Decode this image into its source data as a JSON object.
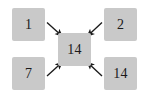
{
  "diagram": {
    "type": "node-arrow-diagram",
    "background_color": "#ffffff",
    "node_fill_color": "#c9c9c9",
    "arrow_color": "#1a1a1a",
    "nodes": [
      {
        "id": "top-left",
        "label": "1",
        "position": "top-left"
      },
      {
        "id": "top-right",
        "label": "2",
        "position": "top-right"
      },
      {
        "id": "center",
        "label": "14",
        "position": "center"
      },
      {
        "id": "bottom-left",
        "label": "7",
        "position": "bottom-left"
      },
      {
        "id": "bottom-right",
        "label": "14",
        "position": "bottom-right"
      }
    ],
    "arrows": [
      {
        "id": "arrow-tl-to-center",
        "from": "top-left",
        "to": "center",
        "direction": "down-right"
      },
      {
        "id": "arrow-tr-to-center",
        "from": "top-right",
        "to": "center",
        "direction": "down-left"
      },
      {
        "id": "arrow-bl-to-center",
        "from": "bottom-left",
        "to": "center",
        "direction": "up-right"
      },
      {
        "id": "arrow-br-to-center",
        "from": "bottom-right",
        "to": "center",
        "direction": "up-left"
      }
    ]
  }
}
